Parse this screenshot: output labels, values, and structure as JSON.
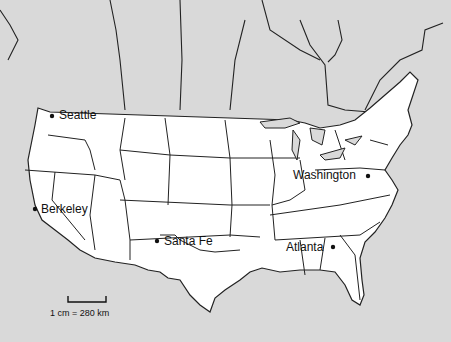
{
  "map": {
    "title": "",
    "cities": [
      {
        "name": "Seattle",
        "x": 52,
        "y": 115
      },
      {
        "name": "Berkeley",
        "x": 34,
        "y": 209
      },
      {
        "name": "Santa Fe",
        "x": 157,
        "y": 241
      },
      {
        "name": "Washington",
        "x": 368,
        "y": 175
      },
      {
        "name": "Atlanta",
        "x": 333,
        "y": 247
      }
    ],
    "scale": {
      "label": "1 cm = 280 km"
    },
    "colors": {
      "land": "#ffffff",
      "background": "#d9d9d9",
      "lines": "#222222"
    }
  }
}
